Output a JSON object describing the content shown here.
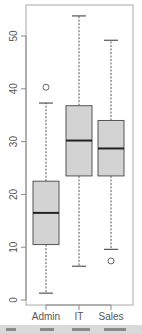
{
  "chart_data": {
    "type": "box",
    "title": "",
    "xlabel": "",
    "ylabel": "",
    "categories": [
      "Admin",
      "IT",
      "Sales"
    ],
    "ylim": [
      -1,
      57
    ],
    "yticks": [
      0,
      10,
      20,
      30,
      40,
      50
    ],
    "ytick_labels": [
      "0",
      "10",
      "20",
      "30",
      "40",
      "50"
    ],
    "grid": false,
    "legend": null,
    "series": [
      {
        "name": "Admin",
        "whisker_low": 1.3,
        "q1": 10.5,
        "median": 16.5,
        "q3": 22.5,
        "whisker_high": 37.3,
        "outliers": [
          40.3
        ]
      },
      {
        "name": "IT",
        "whisker_low": 6.4,
        "q1": 23.5,
        "median": 30.2,
        "q3": 36.8,
        "whisker_high": 53.8,
        "outliers": []
      },
      {
        "name": "Sales",
        "whisker_low": 9.6,
        "q1": 23.5,
        "median": 28.7,
        "q3": 34.0,
        "whisker_high": 49.2,
        "outliers": [
          7.4
        ]
      }
    ]
  },
  "colors": {
    "box_fill": "#d3d3d3",
    "box_stroke": "#555555",
    "axis": "#888888",
    "text": "#555555",
    "median": "#222222"
  }
}
